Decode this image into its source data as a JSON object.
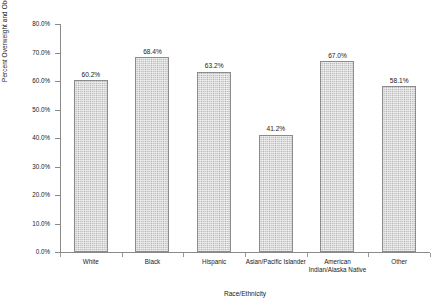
{
  "chart_data": {
    "type": "bar",
    "title": "",
    "xlabel": "Race/Ethnicity",
    "ylabel": "Percent Overweight and Obese",
    "categories": [
      "White",
      "Black",
      "Hispanic",
      "Asian/Pacific Islander",
      "American Indian/Alaska Native",
      "Other"
    ],
    "values": [
      60.2,
      68.4,
      63.2,
      41.2,
      67.0,
      58.1
    ],
    "value_labels": [
      "60.2%",
      "68.4%",
      "63.2%",
      "41.2%",
      "67.0%",
      "58.1%"
    ],
    "ylim": [
      0,
      80
    ],
    "ytick_values": [
      0,
      10,
      20,
      30,
      40,
      50,
      60,
      70,
      80
    ],
    "ytick_labels": [
      "0.0%",
      "10.0%",
      "20.0%",
      "30.0%",
      "40.0%",
      "50.0%",
      "60.0%",
      "70.0%",
      "80.0%"
    ],
    "grid": false,
    "legend": false,
    "bar_fill_color": "#c6c6c6",
    "bar_border_color": "#8c8c8c",
    "axis_color": "#8a8a8a",
    "background_color": "#ffffff"
  }
}
